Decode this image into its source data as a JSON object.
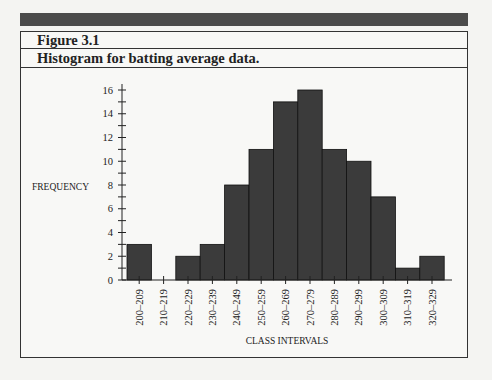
{
  "header": {
    "figure_label": "Figure 3.1",
    "caption": "Histogram for batting average data."
  },
  "colors": {
    "bar_fill": "#3b3b3b",
    "top_bar": "#4b4b4b",
    "border": "#333333"
  },
  "chart_data": {
    "type": "bar",
    "title": "Histogram for batting average data.",
    "xlabel": "CLASS INTERVALS",
    "ylabel": "FREQUENCY",
    "categories": [
      "200–209",
      "210–219",
      "220–229",
      "230–239",
      "240–249",
      "250–259",
      "260–269",
      "270–279",
      "280–289",
      "290–299",
      "300–309",
      "310–319",
      "320–329"
    ],
    "values": [
      3,
      0,
      2,
      3,
      8,
      11,
      15,
      16,
      11,
      10,
      7,
      1,
      2
    ],
    "ylim": [
      0,
      16
    ],
    "y_ticks_labeled": [
      0,
      2,
      4,
      6,
      8,
      10,
      12,
      14,
      16
    ],
    "y_minor_tick_step": 1,
    "grid": false,
    "legend": null
  }
}
